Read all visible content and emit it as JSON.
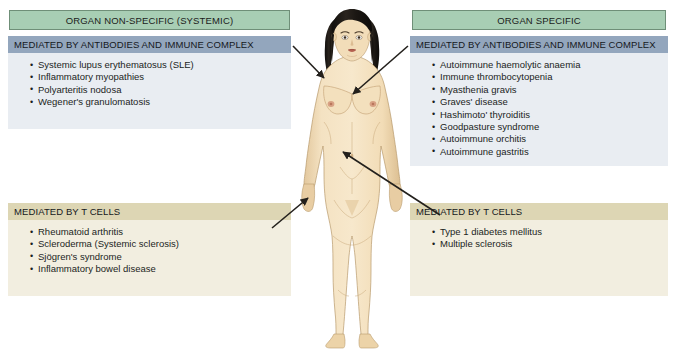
{
  "figure": {
    "subject_illustration": "female-human-body-anterior-view"
  },
  "colors": {
    "category_header_bg": "#a8ceb4",
    "category_header_border": "#6f8f78",
    "antibody_header_bg": "#93a6bd",
    "antibody_body_bg": "#e9edf2",
    "tcell_header_bg": "#ddd6b4",
    "tcell_body_bg": "#f2eee0",
    "arrow": "#23201c",
    "skin": "#f2ddb9",
    "hair": "#1b1814",
    "page_bg": "#ffffff"
  },
  "columns": {
    "left": {
      "category_label": "ORGAN NON-SPECIFIC (SYSTEMIC)",
      "panels": [
        {
          "mechanism": "MEDIATED BY ANTIBODIES AND IMMUNE COMPLEX",
          "diseases": [
            "Systemic lupus erythematosus (SLE)",
            "Inflammatory myopathies",
            "Polyarteritis nodosa",
            "Wegener's granulomatosis"
          ]
        },
        {
          "mechanism": "MEDIATED BY T CELLS",
          "diseases": [
            "Rheumatoid arthritis",
            "Scleroderma (Systemic sclerosis)",
            "Sjögren's syndrome",
            "Inflammatory bowel disease"
          ]
        }
      ]
    },
    "right": {
      "category_label": "ORGAN SPECIFIC",
      "panels": [
        {
          "mechanism": "MEDIATED BY ANTIBODIES AND IMMUNE COMPLEX",
          "diseases": [
            "Autoimmune haemolytic anaemia",
            "Immune thrombocytopenia",
            "Myasthenia gravis",
            "Graves' disease",
            "Hashimoto' thyroiditis",
            "Goodpasture syndrome",
            "Autoimmune orchitis",
            "Autoimmune gastritis"
          ]
        },
        {
          "mechanism": "MEDIATED BY T CELLS",
          "diseases": [
            "Type 1 diabetes mellitus",
            "Multiple sclerosis"
          ]
        }
      ]
    }
  },
  "arrows": [
    {
      "name": "arrow-left-antibody-to-torso",
      "from": "left antibody panel",
      "to": "upper torso / shoulder"
    },
    {
      "name": "arrow-right-antibody-to-chest",
      "from": "right antibody panel",
      "to": "chest"
    },
    {
      "name": "arrow-left-tcell-to-hip",
      "from": "left T cell panel",
      "to": "left hand / hip"
    },
    {
      "name": "arrow-right-tcell-to-abdomen",
      "from": "right T cell panel",
      "to": "lower abdomen"
    }
  ]
}
